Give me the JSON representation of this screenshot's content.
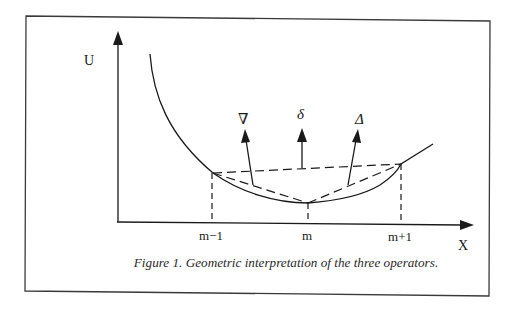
{
  "figure": {
    "caption": "Figure 1. Geometric interpretation of the three operators.",
    "axes": {
      "y_label": "U",
      "x_label": "X"
    },
    "x_ticks": [
      {
        "label": "m−1"
      },
      {
        "label": "m"
      },
      {
        "label": "m+1"
      }
    ],
    "operators": [
      {
        "symbol": "∇",
        "name": "backward-difference"
      },
      {
        "symbol": "δ",
        "name": "central-difference"
      },
      {
        "symbol": "Δ",
        "name": "forward-difference"
      }
    ],
    "colors": {
      "line": "#1a1a1a",
      "frame": "#333333",
      "background": "#ffffff"
    }
  }
}
